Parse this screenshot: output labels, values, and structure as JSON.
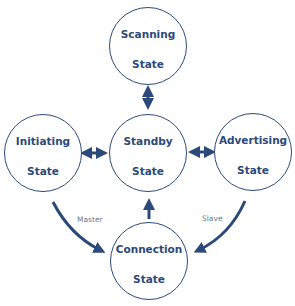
{
  "nodes": {
    "scanning": {
      "line1": "Scanning",
      "line2": "State"
    },
    "standby": {
      "line1": "Standby",
      "line2": "State"
    },
    "initiating": {
      "line1": "Initiating",
      "line2": "State"
    },
    "advertising": {
      "line1": "Advertising",
      "line2": "State"
    },
    "connection": {
      "line1": "Connection",
      "line2": "State"
    }
  },
  "edges": {
    "master": "Master",
    "slave": "Slave"
  },
  "colors": {
    "primary": "#2b4a7a"
  }
}
